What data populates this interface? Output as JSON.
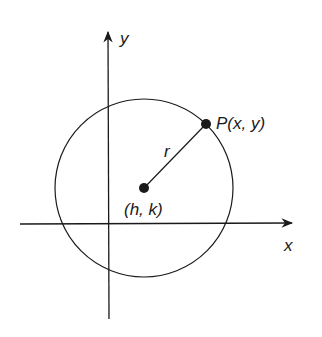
{
  "diagram": {
    "labels": {
      "y_axis": "y",
      "x_axis": "x",
      "point_p": "P(x, y)",
      "center": "(h, k)",
      "radius": "r"
    },
    "geometry": {
      "center": {
        "x": 144,
        "y": 188
      },
      "radius": 89,
      "point_p": {
        "x": 206,
        "y": 124
      },
      "x_axis_y": 224,
      "y_axis_x": 108
    },
    "colors": {
      "stroke": "#1a1a1a",
      "background": "#ffffff"
    }
  }
}
